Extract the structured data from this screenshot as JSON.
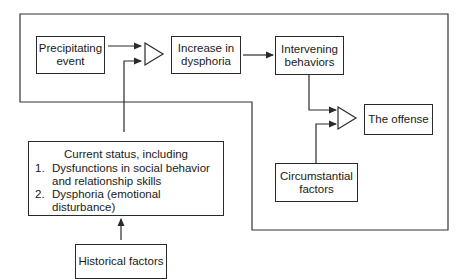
{
  "diagram": {
    "nodes": {
      "precipitating": {
        "line1": "Precipitating",
        "line2": "event"
      },
      "increase": {
        "line1": "Increase in",
        "line2": "dysphoria"
      },
      "intervening": {
        "line1": "Intervening",
        "line2": "behaviors"
      },
      "offense": {
        "label": "The offense"
      },
      "circumstantial": {
        "line1": "Circumstantial",
        "line2": "factors"
      },
      "current_status": {
        "heading": "Current status, including",
        "items": [
          {
            "num": "1.",
            "line1": "Dysfunctions in social behavior",
            "line2": "and relationship skills"
          },
          {
            "num": "2.",
            "line1": "Dysphoria (emotional disturbance)"
          }
        ]
      },
      "historical": {
        "label": "Historical factors"
      }
    },
    "colors": {
      "line": "#2a2a2a",
      "background": "#ffffff"
    }
  }
}
